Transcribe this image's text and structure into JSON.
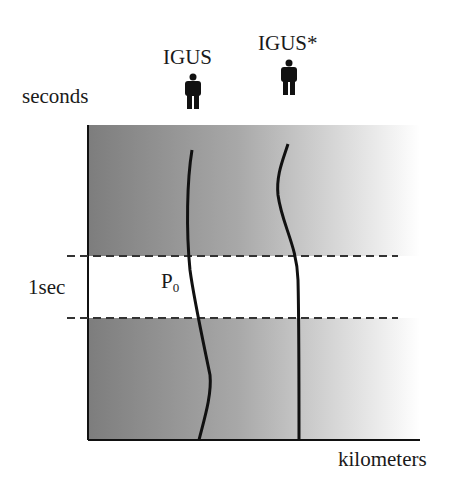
{
  "diagram": {
    "y_axis_label": "seconds",
    "x_axis_label": "kilometers",
    "band_label": "1sec",
    "point_label": {
      "main": "P",
      "sub": "0"
    },
    "observers": [
      {
        "label": "IGUS",
        "icon": "person-icon"
      },
      {
        "label": "IGUS*",
        "icon": "person-icon"
      }
    ],
    "colors": {
      "gradient_dark": "#7d7d7d",
      "gradient_light": "#ffffff",
      "line": "#111111"
    }
  }
}
